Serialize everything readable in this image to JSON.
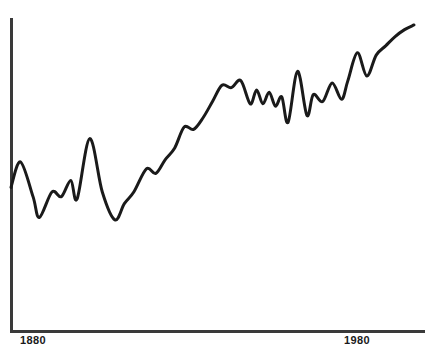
{
  "chart_data": {
    "type": "line",
    "title": "",
    "subtitle": "",
    "xlabel": "",
    "ylabel": "",
    "grid": false,
    "legend": null,
    "axis": {
      "x_axis_visible": true,
      "y_axis_visible": true,
      "x_range": [
        1870,
        1998
      ],
      "tick_labels": [
        "1880",
        "1980"
      ],
      "tick_values": [
        1880,
        1980
      ],
      "y_ticks": [],
      "y_tick_labels": []
    },
    "series": [
      {
        "name": "series-1",
        "color": "#1a1a1a",
        "line_width": 3,
        "x": [
          1870,
          1873,
          1877,
          1879,
          1883,
          1886,
          1889,
          1891,
          1895,
          1899,
          1903,
          1906,
          1909,
          1913,
          1916,
          1919,
          1922,
          1925,
          1928,
          1931,
          1934,
          1937,
          1940,
          1943,
          1946,
          1948,
          1950,
          1952,
          1954,
          1956,
          1958,
          1961,
          1964,
          1966,
          1969,
          1972,
          1975,
          1977,
          1980,
          1983,
          1986,
          1989,
          1992,
          1995,
          1998
        ],
        "values": [
          27,
          38,
          23,
          14,
          25,
          23,
          30,
          22,
          48,
          25,
          13,
          20,
          25,
          35,
          33,
          39,
          44,
          53,
          52,
          57,
          64,
          71,
          70,
          73,
          63,
          69,
          63,
          68,
          62,
          66,
          55,
          77,
          58,
          67,
          64,
          72,
          65,
          73,
          85,
          75,
          84,
          88,
          92,
          95,
          97
        ]
      }
    ],
    "annotations": []
  },
  "axis_labels": {
    "first": "1880",
    "second": "1980"
  },
  "colors": {
    "line": "#1a1a1a",
    "axis": "#3a3a3a",
    "background": "#ffffff"
  }
}
